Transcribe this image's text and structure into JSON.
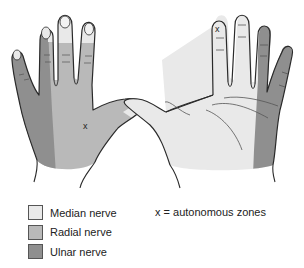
{
  "diagram": {
    "views": [
      {
        "name": "dorsal",
        "autonomous_zone_marker": "x"
      },
      {
        "name": "palmar",
        "autonomous_zone_marker": "x"
      }
    ]
  },
  "colors": {
    "median": "#e9e9e9",
    "radial": "#b9b9b9",
    "ulnar": "#8f8f8f",
    "outline": "#2a2a2a"
  },
  "legend": {
    "items": [
      {
        "label": "Median nerve",
        "color": "#e9e9e9"
      },
      {
        "label": "Radial nerve",
        "color": "#b9b9b9"
      },
      {
        "label": "Ulnar nerve",
        "color": "#8f8f8f"
      }
    ],
    "note": "x = autonomous zones"
  }
}
